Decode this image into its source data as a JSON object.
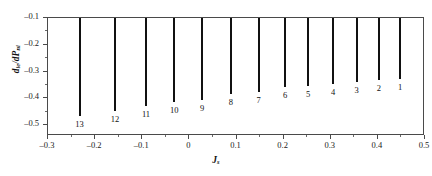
{
  "chart_data": {
    "type": "bar",
    "title": "",
    "xlabel": "J_s",
    "xlabel_base": "J",
    "xlabel_sub": "s",
    "ylabel": "d_ie/dP_ni",
    "ylabel_parts": [
      "d",
      "ie",
      "/d",
      "P",
      "ni"
    ],
    "categories": [
      "13",
      "12",
      "11",
      "10",
      "9",
      "8",
      "7",
      "6",
      "5",
      "4",
      "3",
      "2",
      "1"
    ],
    "x": [
      -0.233,
      -0.158,
      -0.092,
      -0.032,
      0.027,
      0.088,
      0.147,
      0.203,
      0.252,
      0.305,
      0.355,
      0.402,
      0.447
    ],
    "values": [
      -0.465,
      -0.447,
      -0.428,
      -0.412,
      -0.405,
      -0.383,
      -0.377,
      -0.357,
      -0.355,
      -0.345,
      -0.337,
      -0.333,
      -0.327
    ],
    "baseline": -0.1,
    "xlim": [
      -0.3,
      0.5
    ],
    "ylim": [
      -0.54,
      -0.1
    ],
    "xticks": [
      -0.3,
      -0.2,
      -0.1,
      0,
      0.1,
      0.2,
      0.3,
      0.4,
      0.5
    ],
    "xtick_labels": [
      "–0.3",
      "–0.2",
      "–0.1",
      "0",
      "0.1",
      "0.2",
      "0.3",
      "0.4",
      "0.5"
    ],
    "yticks": [
      -0.1,
      -0.2,
      -0.3,
      -0.4,
      -0.5
    ],
    "ytick_labels": [
      "–0.1",
      "–0.2",
      "–0.3",
      "–0.4",
      "–0.5"
    ],
    "y_minor_ticks": [
      -0.15,
      -0.25,
      -0.35,
      -0.45
    ],
    "x_minor_ticks": [
      -0.25,
      -0.15,
      -0.05,
      0.05,
      0.15,
      0.25,
      0.35,
      0.45
    ],
    "grid": false,
    "legend": "none",
    "series_color": "#111111",
    "axis_color": "#4a4a4a",
    "bar_labels_below_end": true
  }
}
